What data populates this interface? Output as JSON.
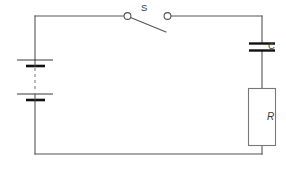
{
  "diagram": {
    "type": "schematic",
    "background_color": "#ffffff",
    "wire_color": "#555555",
    "label_color": "#3a3a3a",
    "labels": {
      "switch": "S",
      "capacitor": "C",
      "resistor": "R"
    },
    "components": [
      {
        "name": "battery",
        "symbol": "two-cell-battery",
        "label": "",
        "position": "left-side",
        "cells": 2,
        "dashed_link": true
      },
      {
        "name": "switch",
        "symbol": "spst-open-switch",
        "label": "S",
        "position": "top-side",
        "state": "open"
      },
      {
        "name": "capacitor",
        "symbol": "parallel-plate-capacitor",
        "label": "C",
        "position": "right-side-upper"
      },
      {
        "name": "resistor",
        "symbol": "rectangular-resistor",
        "label": "R",
        "position": "right-side-lower"
      }
    ],
    "loop": {
      "left_x": 35,
      "right_x": 262,
      "top_y": 16,
      "bottom_y": 154
    }
  }
}
